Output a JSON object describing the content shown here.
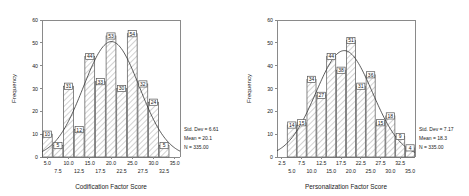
{
  "figure": {
    "panels": [
      {
        "id": "codification",
        "xlabel": "Codification Factor Score",
        "ylabel": "Frequency",
        "stats": {
          "std_dev": "Std. Dev = 6.61",
          "mean": "Mean = 20.1",
          "n": "N = 335.00"
        }
      },
      {
        "id": "personalization",
        "xlabel": "Personalization Factor Score",
        "ylabel": "Frequency",
        "stats": {
          "std_dev": "Std. Dev = 7.17",
          "mean": "Mean = 18.3",
          "n": "N = 335.00"
        }
      }
    ]
  },
  "chart_data": [
    {
      "type": "bar",
      "title": "",
      "xlabel": "Codification Factor Score",
      "ylabel": "Frequency",
      "categories": [
        "5.0",
        "7.5",
        "10.0",
        "12.5",
        "15.0",
        "17.5",
        "20.0",
        "22.5",
        "25.0",
        "27.5",
        "30.0",
        "32.5",
        "35.0"
      ],
      "bin_centers": [
        5.0,
        7.5,
        10.0,
        12.5,
        15.0,
        17.5,
        20.0,
        22.5,
        25.0,
        27.5,
        30.0,
        32.5,
        35.0
      ],
      "values": [
        10,
        5,
        31,
        12,
        44,
        33,
        53,
        30,
        54,
        32,
        24,
        5,
        0
      ],
      "bar_labels": [
        "10",
        "5",
        "31",
        "12",
        "44",
        "33",
        "53",
        "30",
        "54",
        "32",
        "24",
        "5"
      ],
      "ylim": [
        0,
        60
      ],
      "yticks": [
        0,
        10,
        20,
        30,
        40,
        50,
        60
      ],
      "xticks_upper": [
        "5.0",
        "10.0",
        "15.0",
        "20.0",
        "25.0",
        "30.0",
        "35.0"
      ],
      "xticks_lower": [
        "7.5",
        "12.5",
        "17.5",
        "22.5",
        "27.5",
        "32.5"
      ],
      "grid": false,
      "legend": "none",
      "overlay": "normal-curve",
      "annotations": [
        "Std. Dev = 6.61",
        "Mean = 20.1",
        "N = 335.00"
      ],
      "statistics": {
        "std_dev": 6.61,
        "mean": 20.1,
        "n": 335.0
      }
    },
    {
      "type": "bar",
      "title": "",
      "xlabel": "Personalization Factor Score",
      "ylabel": "Frequency",
      "categories": [
        "2.5",
        "5.0",
        "7.5",
        "10.0",
        "12.5",
        "15.0",
        "17.5",
        "20.0",
        "22.5",
        "25.0",
        "27.5",
        "30.0",
        "32.5",
        "35.0"
      ],
      "bin_centers": [
        2.5,
        5.0,
        7.5,
        10.0,
        12.5,
        15.0,
        17.5,
        20.0,
        22.5,
        25.0,
        27.5,
        30.0,
        32.5,
        35.0
      ],
      "values": [
        0,
        14,
        15,
        34,
        27,
        44,
        38,
        51,
        31,
        36,
        15,
        18,
        9,
        4
      ],
      "bar_labels": [
        "14",
        "15",
        "34",
        "27",
        "44",
        "38",
        "51",
        "31",
        "36",
        "15",
        "18",
        "9",
        "4"
      ],
      "ylim": [
        0,
        60
      ],
      "yticks": [
        0,
        10,
        20,
        30,
        40,
        50,
        60
      ],
      "xticks_upper": [
        "2.5",
        "7.5",
        "12.5",
        "17.5",
        "22.5",
        "27.5",
        "32.5"
      ],
      "xticks_lower": [
        "5.0",
        "10.0",
        "15.0",
        "20.0",
        "25.0",
        "30.0",
        "35.0"
      ],
      "grid": false,
      "legend": "none",
      "overlay": "normal-curve",
      "annotations": [
        "Std. Dev = 7.17",
        "Mean = 18.3",
        "N = 335.00"
      ],
      "statistics": {
        "std_dev": 7.17,
        "mean": 18.3,
        "n": 335.0
      }
    }
  ]
}
